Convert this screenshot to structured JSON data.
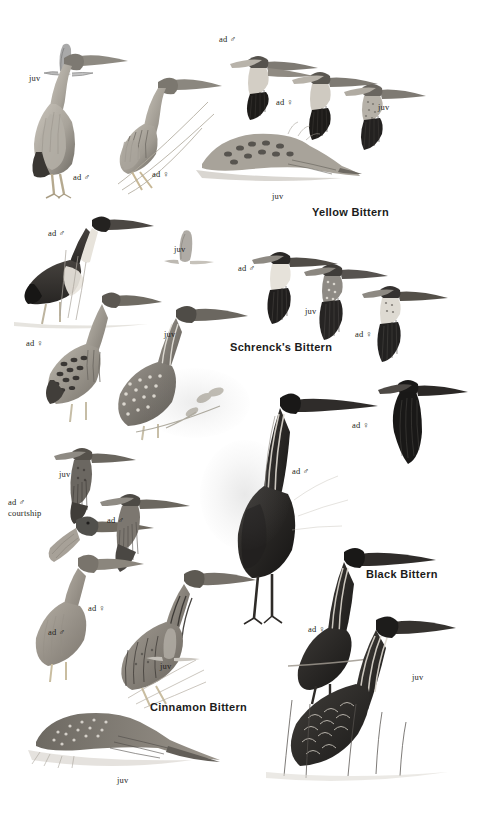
{
  "plate": {
    "title": "Bitterns plate",
    "medium": "colour-pencil field-guide illustration",
    "background_color": "#ffffff",
    "ink_color": "#231f20",
    "width": 486,
    "height": 815
  },
  "species": [
    {
      "id": "yellow",
      "name": "Yellow Bittern",
      "x": 312,
      "y": 206
    },
    {
      "id": "schrenck",
      "name": "Schrenck's Bittern",
      "x": 230,
      "y": 341
    },
    {
      "id": "black",
      "name": "Black Bittern",
      "x": 366,
      "y": 568
    },
    {
      "id": "cinnamon",
      "name": "Cinnamon Bittern",
      "x": 150,
      "y": 701
    }
  ],
  "labels": [
    {
      "id": "yb-juv-fly-left",
      "text": "juv",
      "x": 29,
      "y": 74,
      "species": "yellow"
    },
    {
      "id": "yb-ad-m-perch",
      "text": "ad ♂",
      "x": 73,
      "y": 173,
      "species": "yellow"
    },
    {
      "id": "yb-ad-f-perch",
      "text": "ad ♀",
      "x": 152,
      "y": 170,
      "species": "yellow"
    },
    {
      "id": "yb-ad-m-fly",
      "text": "ad ♂",
      "x": 219,
      "y": 35,
      "species": "yellow"
    },
    {
      "id": "yb-ad-f-fly",
      "text": "ad ♀",
      "x": 276,
      "y": 98,
      "species": "yellow"
    },
    {
      "id": "yb-juv-fly-right",
      "text": "juv",
      "x": 378,
      "y": 103,
      "species": "yellow"
    },
    {
      "id": "yb-juv-crouch",
      "text": "juv",
      "x": 272,
      "y": 192,
      "species": "yellow"
    },
    {
      "id": "sb-ad-m-perch",
      "text": "ad ♂",
      "x": 48,
      "y": 229,
      "species": "schrenck"
    },
    {
      "id": "sb-juv-fly-small",
      "text": "juv",
      "x": 174,
      "y": 245,
      "species": "schrenck"
    },
    {
      "id": "sb-ad-f-perch",
      "text": "ad ♀",
      "x": 26,
      "y": 339,
      "species": "schrenck"
    },
    {
      "id": "sb-juv-perch",
      "text": "juv",
      "x": 164,
      "y": 330,
      "species": "schrenck"
    },
    {
      "id": "sb-ad-m-fly",
      "text": "ad ♂",
      "x": 238,
      "y": 264,
      "species": "schrenck"
    },
    {
      "id": "sb-juv-fly",
      "text": "juv",
      "x": 305,
      "y": 307,
      "species": "schrenck"
    },
    {
      "id": "sb-ad-f-fly",
      "text": "ad ♀",
      "x": 355,
      "y": 330,
      "species": "schrenck"
    },
    {
      "id": "bb-ad-f-fly",
      "text": "ad ♀",
      "x": 352,
      "y": 421,
      "species": "black"
    },
    {
      "id": "bb-ad-m-perch",
      "text": "ad ♂",
      "x": 292,
      "y": 467,
      "species": "black"
    },
    {
      "id": "bb-ad-f-perch",
      "text": "ad ♀",
      "x": 308,
      "y": 625,
      "species": "black"
    },
    {
      "id": "bb-juv-perch",
      "text": "juv",
      "x": 412,
      "y": 673,
      "species": "black"
    },
    {
      "id": "cb-juv-fly",
      "text": "juv",
      "x": 59,
      "y": 470,
      "species": "cinnamon"
    },
    {
      "id": "cb-ad-m-courtship",
      "text": "ad ♂\ncourtship",
      "x": 8,
      "y": 497,
      "species": "cinnamon"
    },
    {
      "id": "cb-ad-m-fly",
      "text": "ad ♂",
      "x": 107,
      "y": 516,
      "species": "cinnamon"
    },
    {
      "id": "cb-ad-f-perch",
      "text": "ad ♀",
      "x": 88,
      "y": 604,
      "species": "cinnamon"
    },
    {
      "id": "cb-ad-m-perch",
      "text": "ad ♂",
      "x": 48,
      "y": 628,
      "species": "cinnamon"
    },
    {
      "id": "cb-juv-small",
      "text": "juv",
      "x": 160,
      "y": 662,
      "species": "cinnamon"
    },
    {
      "id": "cb-juv-crouch",
      "text": "juv",
      "x": 117,
      "y": 776,
      "species": "cinnamon"
    }
  ]
}
